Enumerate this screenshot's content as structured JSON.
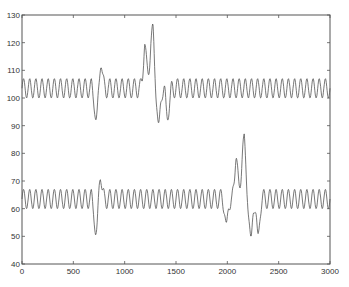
{
  "chart_data": {
    "type": "line",
    "title": "",
    "xlabel": "",
    "ylabel": "",
    "xlim": [
      0,
      3000
    ],
    "ylim": [
      40,
      130
    ],
    "grid": false,
    "legend": null,
    "x_ticks": [
      "0",
      "500",
      "1000",
      "1500",
      "2000",
      "2500",
      "3000"
    ],
    "y_ticks": [
      "40",
      "50",
      "60",
      "70",
      "80",
      "90",
      "100",
      "110",
      "120",
      "130"
    ],
    "line_color": "#555555",
    "series": [
      {
        "name": "upper signal",
        "baseline_min": 100,
        "baseline_max": 107,
        "period_samples": 60,
        "events": [
          {
            "x": 720,
            "value": 92,
            "note": "sharp dip"
          },
          {
            "x": 770,
            "value": 111,
            "note": "peak after dip"
          },
          {
            "x": 1200,
            "value": 120,
            "note": "large peak"
          },
          {
            "x": 1235,
            "value": 106,
            "note": "notch"
          },
          {
            "x": 1270,
            "value": 128,
            "note": "max peak"
          },
          {
            "x": 1330,
            "value": 91,
            "note": "trough"
          },
          {
            "x": 1420,
            "value": 92,
            "note": "trough"
          }
        ]
      },
      {
        "name": "lower signal",
        "baseline_min": 60,
        "baseline_max": 67,
        "period_samples": 60,
        "events": [
          {
            "x": 720,
            "value": 50,
            "note": "sharp dip"
          },
          {
            "x": 760,
            "value": 71,
            "note": "peak after dip"
          },
          {
            "x": 1990,
            "value": 55,
            "note": "trough"
          },
          {
            "x": 2090,
            "value": 79,
            "note": "large peak"
          },
          {
            "x": 2125,
            "value": 65,
            "note": "notch"
          },
          {
            "x": 2160,
            "value": 88,
            "note": "max peak"
          },
          {
            "x": 2230,
            "value": 50,
            "note": "trough"
          },
          {
            "x": 2300,
            "value": 51,
            "note": "trough"
          }
        ]
      }
    ]
  }
}
